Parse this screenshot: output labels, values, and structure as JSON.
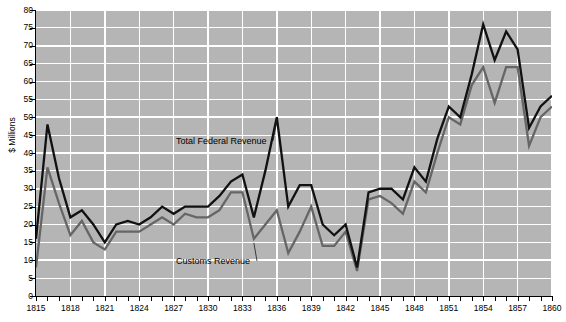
{
  "chart_data": {
    "type": "line",
    "title": "",
    "xlabel": "",
    "ylabel": "$ Millions",
    "xlim": [
      1815,
      1860
    ],
    "ylim": [
      0,
      80
    ],
    "y_ticks": [
      0,
      5,
      10,
      15,
      20,
      25,
      30,
      35,
      40,
      45,
      50,
      55,
      60,
      65,
      70,
      75,
      80
    ],
    "x_ticks_labeled": [
      1815,
      1818,
      1821,
      1824,
      1827,
      1830,
      1833,
      1836,
      1839,
      1842,
      1845,
      1848,
      1851,
      1854,
      1857,
      1860
    ],
    "x_tick_step": 1,
    "grid": true,
    "legend_position": "inline-annotations",
    "x": [
      1815,
      1816,
      1817,
      1818,
      1819,
      1820,
      1821,
      1822,
      1823,
      1824,
      1825,
      1826,
      1827,
      1828,
      1829,
      1830,
      1831,
      1832,
      1833,
      1834,
      1835,
      1836,
      1837,
      1838,
      1839,
      1840,
      1841,
      1842,
      1843,
      1844,
      1845,
      1846,
      1847,
      1848,
      1849,
      1850,
      1851,
      1852,
      1853,
      1854,
      1855,
      1856,
      1857,
      1858,
      1859,
      1860
    ],
    "series": [
      {
        "name": "Total Federal Revenue",
        "color": "#111111",
        "values": [
          16,
          48,
          33,
          22,
          24,
          20,
          15,
          20,
          21,
          20,
          22,
          25,
          23,
          25,
          25,
          25,
          28,
          32,
          34,
          22,
          35,
          50,
          25,
          31,
          31,
          20,
          17,
          20,
          8,
          29,
          30,
          30,
          27,
          36,
          32,
          44,
          53,
          50,
          62,
          76,
          66,
          74,
          69,
          47,
          53,
          56
        ]
      },
      {
        "name": "Customs Revenue",
        "color": "#666666",
        "values": [
          8,
          36,
          26,
          17,
          21,
          15,
          13,
          18,
          18,
          18,
          20,
          22,
          20,
          23,
          22,
          22,
          24,
          29,
          29,
          16,
          20,
          24,
          12,
          18,
          25,
          14,
          14,
          18,
          7,
          27,
          28,
          26,
          23,
          32,
          29,
          40,
          50,
          48,
          59,
          64,
          54,
          64,
          64,
          42,
          50,
          53
        ]
      }
    ],
    "annotations": [
      {
        "text": "Total Federal Revenue",
        "target_year": 1836,
        "target_value": 50
      },
      {
        "text": "Customs Revenue",
        "target_year": 1834,
        "target_value": 16
      }
    ]
  }
}
